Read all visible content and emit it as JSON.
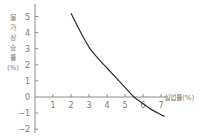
{
  "chart_data": {
    "type": "line",
    "title": "",
    "xlabel": "실업률(%)",
    "ylabel": "물가상승률(%)",
    "ylabel_chars": [
      "물",
      "가",
      "상",
      "승",
      "률",
      "(%)"
    ],
    "x_ticks": [
      "1",
      "2",
      "3",
      "4",
      "5",
      "6",
      "7"
    ],
    "y_ticks": [
      "5",
      "4",
      "3",
      "2",
      "1",
      "0",
      "-1",
      "-2"
    ],
    "xlim": [
      0,
      8
    ],
    "ylim": [
      -2,
      5.5
    ],
    "grid": false,
    "legend": null,
    "series": [
      {
        "name": "필립스 곡선",
        "x": [
          2.0,
          2.5,
          3.0,
          3.5,
          4.0,
          4.5,
          5.0,
          5.5,
          6.0,
          6.5,
          7.0,
          7.2
        ],
        "y": [
          5.2,
          4.1,
          3.1,
          2.4,
          1.8,
          1.2,
          0.6,
          0.0,
          -0.4,
          -0.8,
          -1.1,
          -1.2
        ]
      }
    ],
    "colors": {
      "line": "#2b2b2b",
      "axis": "#8a8a8a",
      "text": "#7a7a7a"
    }
  }
}
